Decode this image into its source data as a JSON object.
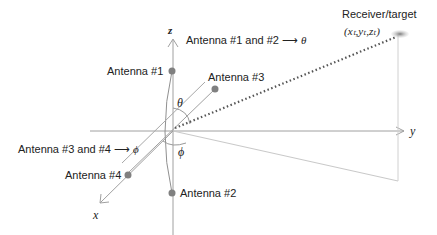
{
  "diagram": {
    "axes": {
      "x_label": "x",
      "y_label": "y",
      "z_label": "z"
    },
    "antennas": [
      {
        "label": "Antenna #1"
      },
      {
        "label": "Antenna #2"
      },
      {
        "label": "Antenna #3"
      },
      {
        "label": "Antenna #4"
      }
    ],
    "annotations": {
      "theta_pair": "Antenna #1 and #2",
      "theta_symbol": "θ",
      "phi_pair": "Antenna #3 and #4",
      "phi_symbol": "ϕ",
      "arrow": "⟶"
    },
    "angles": {
      "theta": "θ",
      "phi": "ϕ"
    },
    "receiver": {
      "label": "Receiver/target",
      "coords": "(xₜ,yₜ,zₜ)"
    },
    "colors": {
      "axis": "#9a9a9a",
      "antenna": "#808080",
      "dotted": "#555555",
      "receiver": "#8a8a8a"
    }
  }
}
